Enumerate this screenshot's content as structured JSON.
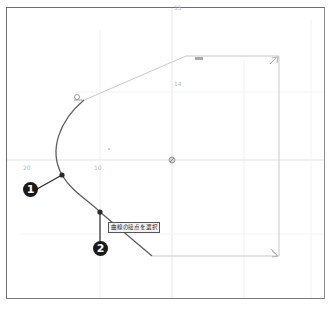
{
  "canvas": {
    "background": "#ffffff",
    "frame_color": "#6e6e6e",
    "grid_color": "#e6e6e6",
    "curve_color": "#5a5a5a",
    "construction_color": "#c8c8c8"
  },
  "callouts": [
    {
      "number": "1",
      "label": "1",
      "target": "curve-point-upper"
    },
    {
      "number": "2",
      "label": "2",
      "target": "curve-point-lower"
    }
  ],
  "tooltip": {
    "text": "曲線の接点を選択"
  },
  "axis_labels": {
    "left": "20",
    "mid": "10",
    "top": "15",
    "upper": "14",
    "dim_top": "888"
  }
}
